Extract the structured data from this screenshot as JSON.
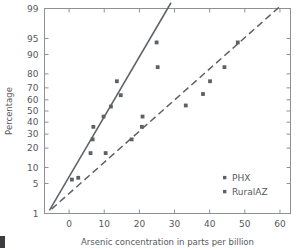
{
  "chart_data": {
    "type": "scatter",
    "title": "",
    "xlabel": "Arsenic concentration in parts per billion",
    "ylabel": "Percentage",
    "xlim": [
      -7,
      63
    ],
    "ylim": [
      1,
      99
    ],
    "yscale": "probability",
    "grid": false,
    "xticks": [
      0,
      10,
      20,
      30,
      40,
      50,
      60
    ],
    "xtick_labels": [
      "0",
      "10",
      "20",
      "30",
      "40",
      "50",
      "60"
    ],
    "yticks": [
      1,
      5,
      10,
      20,
      30,
      40,
      50,
      60,
      70,
      80,
      90,
      95,
      99
    ],
    "ytick_labels": [
      "1",
      "5",
      "10",
      "20",
      "30",
      "40",
      "50",
      "60",
      "70",
      "80",
      "90",
      "95",
      "99"
    ],
    "legend_position": "lower-right",
    "series": [
      {
        "name": "PHX",
        "marker": "square",
        "color": "#5d6165",
        "fit_line": "solid",
        "points": [
          {
            "x": 0.8,
            "y": 6
          },
          {
            "x": 2.6,
            "y": 6.5
          },
          {
            "x": 6.1,
            "y": 17
          },
          {
            "x": 6.7,
            "y": 26
          },
          {
            "x": 6.9,
            "y": 36
          },
          {
            "x": 9.8,
            "y": 45
          },
          {
            "x": 11.9,
            "y": 54
          },
          {
            "x": 14.7,
            "y": 64
          },
          {
            "x": 13.6,
            "y": 75
          },
          {
            "x": 24.9,
            "y": 94
          },
          {
            "x": 25.2,
            "y": 84
          }
        ],
        "fit_endpoints": [
          {
            "x": -5.6,
            "y": 1.2
          },
          {
            "x": 29.0,
            "y": 99.3
          }
        ]
      },
      {
        "name": "RuralAZ",
        "marker": "square",
        "color": "#5d6165",
        "fit_line": "dashed",
        "points": [
          {
            "x": 10.4,
            "y": 17
          },
          {
            "x": 17.8,
            "y": 26
          },
          {
            "x": 20.7,
            "y": 36
          },
          {
            "x": 20.9,
            "y": 45
          },
          {
            "x": 33.2,
            "y": 55
          },
          {
            "x": 38.1,
            "y": 65
          },
          {
            "x": 40.1,
            "y": 75
          },
          {
            "x": 44.2,
            "y": 84
          },
          {
            "x": 48.0,
            "y": 94
          }
        ],
        "fit_endpoints": [
          {
            "x": -5.0,
            "y": 1.3
          },
          {
            "x": 60.5,
            "y": 99.2
          }
        ]
      }
    ]
  },
  "legend": {
    "items": [
      {
        "label": "PHX"
      },
      {
        "label": "RuralAZ"
      }
    ]
  },
  "axes": {
    "y_title": "Percentage",
    "x_title": "Arsenic concentration in parts per billion"
  }
}
